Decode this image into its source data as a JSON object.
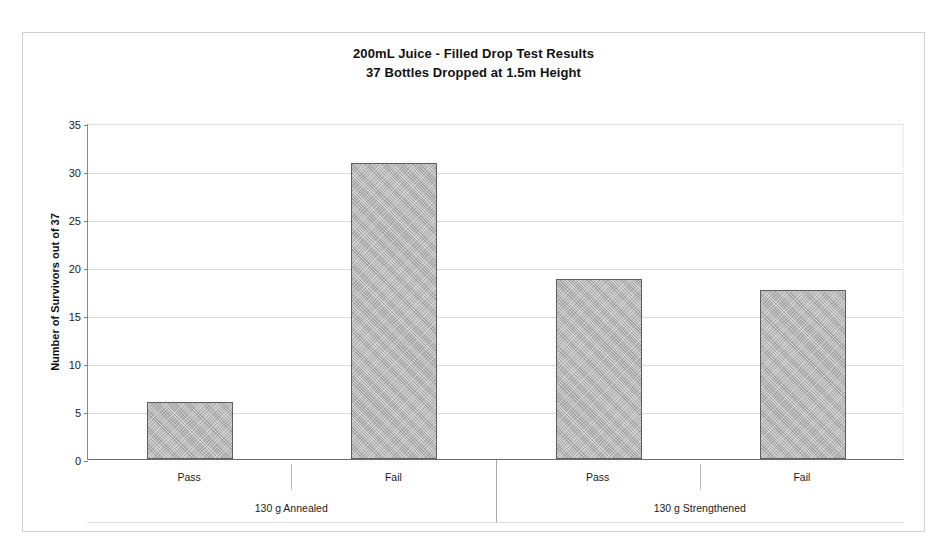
{
  "chart_data": {
    "type": "bar",
    "title": "200mL Juice -  Filled Drop Test Results",
    "subtitle": "37 Bottles Dropped at 1.5m Height",
    "xlabel": "",
    "ylabel": "Number of Survivors out of 37",
    "ylim": [
      0,
      35
    ],
    "ytick_step": 5,
    "yticks": [
      35,
      30,
      25,
      20,
      15,
      10,
      5,
      0
    ],
    "grid": true,
    "legend": "none",
    "categories": [
      "Pass",
      "Fail",
      "Pass",
      "Fail"
    ],
    "groups": [
      {
        "label": "130 g Annealed",
        "categories": [
          "Pass",
          "Fail"
        ],
        "values": [
          5.9,
          30.8
        ]
      },
      {
        "label": "130 g Strengthened",
        "categories": [
          "Pass",
          "Fail"
        ],
        "values": [
          18.7,
          17.6
        ]
      }
    ],
    "values": [
      5.9,
      30.8,
      18.7,
      17.6
    ],
    "bar_color": "#b4b4b4",
    "bar_border_color": "#5e5e5e"
  },
  "chart": {
    "title_line1": "200mL Juice -  Filled Drop Test Results",
    "title_line2": "37 Bottles Dropped at 1.5m Height",
    "yaxis_title": "Number of Survivors out of 37",
    "yticks": [
      {
        "value": 35,
        "label": "35"
      },
      {
        "value": 30,
        "label": "30"
      },
      {
        "value": 25,
        "label": "25"
      },
      {
        "value": 20,
        "label": "20"
      },
      {
        "value": 15,
        "label": "15"
      },
      {
        "value": 10,
        "label": "10"
      },
      {
        "value": 5,
        "label": "5"
      },
      {
        "value": 0,
        "label": "0"
      }
    ],
    "bars": [
      {
        "label": "Pass",
        "value": 5.9,
        "group": "130 g Annealed"
      },
      {
        "label": "Fail",
        "value": 30.8,
        "group": "130 g Annealed"
      },
      {
        "label": "Pass",
        "value": 18.7,
        "group": "130 g Strengthened"
      },
      {
        "label": "Fail",
        "value": 17.6,
        "group": "130 g Strengthened"
      }
    ],
    "subcategories": [
      "Pass",
      "Fail",
      "Pass",
      "Fail"
    ],
    "group_labels": [
      "130 g Annealed",
      "130 g Strengthened"
    ],
    "colors": {
      "bar_fill": "#b4b4b4",
      "bar_border": "#5e5e5e",
      "gridline": "#d9d9d9",
      "axis": "#7a7a7a",
      "frame": "#cfcfcf",
      "text": "#111111"
    }
  }
}
